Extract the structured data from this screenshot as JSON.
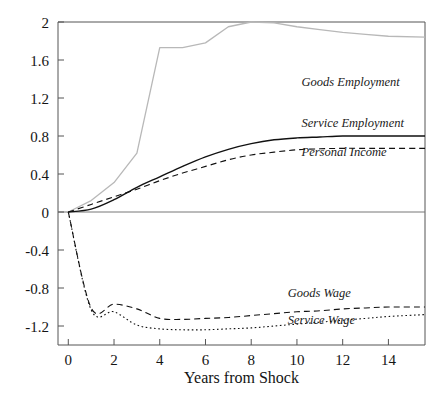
{
  "chart_data": {
    "type": "line",
    "title": "",
    "xlabel": "Years from Shock",
    "ylabel": "",
    "xlim": [
      -0.45,
      15.6
    ],
    "ylim": [
      -1.4,
      2.0
    ],
    "grid": false,
    "legend_position": "inline-right",
    "xticks": [
      0,
      2,
      4,
      6,
      8,
      10,
      12,
      14
    ],
    "xtick_labels": [
      "0",
      "2",
      "4",
      "6",
      "8",
      "10",
      "12",
      "14"
    ],
    "yticks": [
      2,
      1.6,
      1.2,
      0.8,
      0.4,
      0,
      -0.4,
      -0.8,
      -1.2
    ],
    "ytick_labels": [
      "2",
      "1.6",
      "1.2",
      "0.8",
      "0.4",
      "0",
      "-0.4",
      "-0.8",
      "-1.2"
    ],
    "x": [
      0,
      1,
      2,
      3,
      4,
      5,
      6,
      7,
      8,
      9,
      10,
      11,
      12,
      13,
      14,
      15.6
    ],
    "series": [
      {
        "name": "Goods Employment",
        "label": "Goods Employment",
        "style": "solid-light",
        "color": "#b8b8b8",
        "label_x": 10.2,
        "label_y": 1.33,
        "values": [
          0.0,
          0.12,
          0.31,
          0.62,
          1.73,
          1.73,
          1.78,
          1.95,
          2.0,
          1.99,
          1.95,
          1.92,
          1.89,
          1.87,
          1.85,
          1.84
        ]
      },
      {
        "name": "Service Employment",
        "label": "Service Employment",
        "style": "solid",
        "color": "#111111",
        "label_x": 10.2,
        "label_y": 0.9,
        "values": [
          0.0,
          0.03,
          0.13,
          0.26,
          0.37,
          0.48,
          0.58,
          0.66,
          0.72,
          0.76,
          0.78,
          0.79,
          0.8,
          0.8,
          0.8,
          0.8
        ]
      },
      {
        "name": "Personal Income",
        "label": "Personal Income",
        "style": "dashed",
        "color": "#111111",
        "label_x": 10.2,
        "label_y": 0.59,
        "values": [
          0.0,
          0.08,
          0.16,
          0.24,
          0.33,
          0.41,
          0.48,
          0.55,
          0.6,
          0.63,
          0.655,
          0.665,
          0.67,
          0.67,
          0.67,
          0.67
        ]
      },
      {
        "name": "Goods Wage",
        "label": "Goods Wage",
        "style": "dashed",
        "color": "#111111",
        "label_x": 9.6,
        "label_y": -0.89,
        "values": [
          0.0,
          -1.01,
          -0.97,
          -1.02,
          -1.12,
          -1.13,
          -1.12,
          -1.11,
          -1.09,
          -1.07,
          -1.05,
          -1.04,
          -1.02,
          -1.01,
          -1.0,
          -1.0
        ]
      },
      {
        "name": "Service Wage",
        "label": "Service Wage",
        "style": "dotted",
        "color": "#111111",
        "label_x": 9.6,
        "label_y": -1.18,
        "values": [
          0.0,
          -1.03,
          -1.05,
          -1.19,
          -1.23,
          -1.24,
          -1.24,
          -1.23,
          -1.22,
          -1.2,
          -1.18,
          -1.16,
          -1.14,
          -1.12,
          -1.1,
          -1.08
        ]
      }
    ]
  }
}
